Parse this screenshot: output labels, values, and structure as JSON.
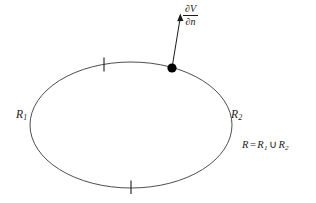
{
  "figure": {
    "type": "geometry-diagram",
    "background_color": "#ffffff",
    "stroke_color": "#3a3a3a",
    "text_color": "#1a1a1a",
    "width": 316,
    "height": 203
  },
  "region": {
    "boundary_shape": "ellipse",
    "center_x": 131,
    "center_y": 125,
    "radius_x": 101,
    "radius_y": 63
  },
  "labels": {
    "region_left": {
      "base": "R",
      "subscript": "1",
      "x": 16,
      "y": 109
    },
    "region_right": {
      "base": "R",
      "subscript": "2",
      "x": 231,
      "y": 109
    },
    "union_equation": {
      "lhs": "R",
      "equals": "=",
      "term1_base": "R",
      "term1_sub": "1",
      "union_symbol": "∪",
      "term2_base": "R",
      "term2_sub": "2",
      "full_text": "R = R1 ∪ R2",
      "x": 242,
      "y": 140
    },
    "normal_derivative": {
      "numerator_partial": "∂",
      "numerator_var": "V",
      "denominator_partial": "∂",
      "denominator_var": "n",
      "full_text": "∂V/∂n",
      "x": 183,
      "y": 4
    }
  },
  "markers": {
    "boundary_point": {
      "x": 172,
      "y": 68,
      "radius": 4.6,
      "fill": "#000000"
    },
    "tick_marks": [
      {
        "name": "tick-upper-left",
        "x": 104,
        "y": 64,
        "length": 13,
        "angle_deg": 6
      },
      {
        "name": "tick-bottom",
        "x": 131,
        "y": 187,
        "length": 13,
        "angle_deg": 0
      }
    ]
  },
  "arrow": {
    "name": "outward-normal-arrow",
    "from_x": 172,
    "from_y": 68,
    "to_x": 180,
    "to_y": 14,
    "head_length": 7,
    "head_width": 4
  }
}
